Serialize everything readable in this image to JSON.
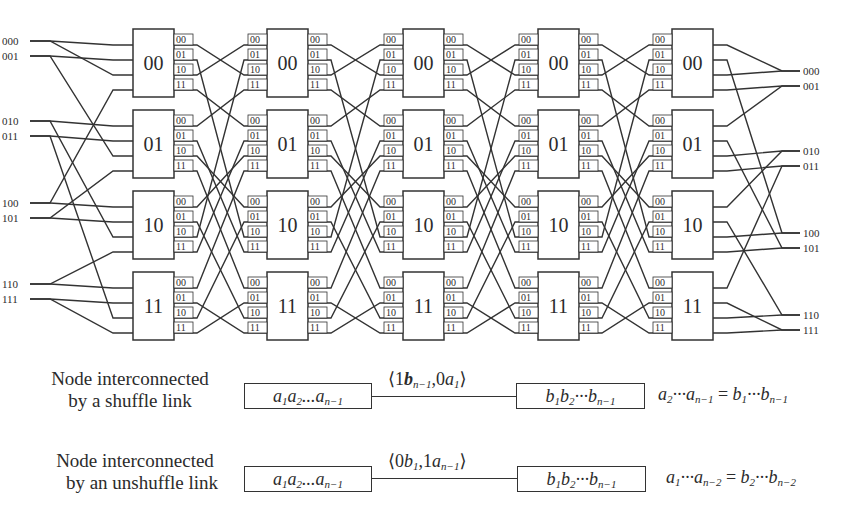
{
  "diagram": {
    "node_labels": [
      "00",
      "01",
      "10",
      "11"
    ],
    "port_labels": [
      "00",
      "01",
      "10",
      "11"
    ],
    "columns_x": [
      133,
      267,
      403,
      538,
      672
    ],
    "box_width": 41,
    "rows_y": [
      29,
      110,
      191,
      272
    ],
    "box_height": 68,
    "port_offsets": [
      12,
      27,
      42,
      57
    ],
    "port_label_width": 19,
    "inputs": {
      "labels": [
        "000",
        "001",
        "010",
        "011",
        "100",
        "101",
        "110",
        "111"
      ],
      "y": [
        41,
        56,
        121,
        136,
        203,
        218,
        284,
        299
      ],
      "label_x": 2,
      "line_start_x": 30,
      "fork_x": 50,
      "edges": [
        {
          "in": 0,
          "node": 0,
          "port": 0
        },
        {
          "in": 0,
          "node": 0,
          "port": 2
        },
        {
          "in": 1,
          "node": 0,
          "port": 1
        },
        {
          "in": 1,
          "node": 1,
          "port": 2
        },
        {
          "in": 2,
          "node": 1,
          "port": 0
        },
        {
          "in": 2,
          "node": 2,
          "port": 2
        },
        {
          "in": 3,
          "node": 1,
          "port": 1
        },
        {
          "in": 3,
          "node": 3,
          "port": 2
        },
        {
          "in": 4,
          "node": 2,
          "port": 0
        },
        {
          "in": 4,
          "node": 0,
          "port": 3
        },
        {
          "in": 5,
          "node": 2,
          "port": 1
        },
        {
          "in": 5,
          "node": 1,
          "port": 3
        },
        {
          "in": 6,
          "node": 3,
          "port": 0
        },
        {
          "in": 6,
          "node": 2,
          "port": 3
        },
        {
          "in": 7,
          "node": 3,
          "port": 1
        },
        {
          "in": 7,
          "node": 3,
          "port": 3
        }
      ]
    },
    "outputs": {
      "labels": [
        "000",
        "001",
        "010",
        "011",
        "100",
        "101",
        "110",
        "111"
      ],
      "y": [
        71,
        86,
        151,
        166,
        233,
        248,
        315,
        330
      ],
      "label_x": 803,
      "line_end_x": 800,
      "merge_x": 782,
      "edges": [
        {
          "node": 0,
          "port": 0,
          "out": 0
        },
        {
          "node": 0,
          "port": 1,
          "out": 4
        },
        {
          "node": 0,
          "port": 2,
          "out": 0
        },
        {
          "node": 0,
          "port": 3,
          "out": 1
        },
        {
          "node": 1,
          "port": 0,
          "out": 1
        },
        {
          "node": 1,
          "port": 1,
          "out": 5
        },
        {
          "node": 1,
          "port": 2,
          "out": 2
        },
        {
          "node": 1,
          "port": 3,
          "out": 3
        },
        {
          "node": 2,
          "port": 0,
          "out": 2
        },
        {
          "node": 2,
          "port": 1,
          "out": 6
        },
        {
          "node": 2,
          "port": 2,
          "out": 4
        },
        {
          "node": 2,
          "port": 3,
          "out": 5
        },
        {
          "node": 3,
          "port": 0,
          "out": 3
        },
        {
          "node": 3,
          "port": 1,
          "out": 7
        },
        {
          "node": 3,
          "port": 2,
          "out": 6
        },
        {
          "node": 3,
          "port": 3,
          "out": 7
        }
      ]
    },
    "line_color": "#333333",
    "box_fill": "#ffffff"
  },
  "legend": {
    "shuffle": {
      "description_line1": "Node interconnected",
      "description_line2": "by a shuffle link",
      "left_node": {
        "base": "a",
        "parts": [
          "1",
          "2",
          "n−1"
        ]
      },
      "link_label": "⟨1bₙ₋₁,0a₁⟩",
      "link_label_parts": {
        "p1": "⟨1",
        "v1": "b",
        "s1": "n−1",
        "p2": ",0",
        "v2": "a",
        "s2": "1",
        "p3": "⟩"
      },
      "right_node": {
        "base": "b",
        "parts": [
          "1",
          "2",
          "n−1"
        ]
      },
      "equation": {
        "lhs_var": "a",
        "lhs_sub1": "2",
        "lhs_sub2": "n−1",
        "op": "=",
        "rhs_var": "b",
        "rhs_sub1": "1",
        "rhs_sub2": "n−1"
      }
    },
    "unshuffle": {
      "description_line1": "Node interconnected",
      "description_line2": "by an unshuffle link",
      "left_node": {
        "base": "a",
        "parts": [
          "1",
          "2",
          "n−1"
        ]
      },
      "link_label": "⟨0b₁,1aₙ₋₁⟩",
      "link_label_parts": {
        "p1": "⟨0",
        "v1": "b",
        "s1": "1",
        "p2": ",1",
        "v2": "a",
        "s2": "n−1",
        "p3": "⟩"
      },
      "right_node": {
        "base": "b",
        "parts": [
          "1",
          "2",
          "n−1"
        ]
      },
      "equation": {
        "lhs_var": "a",
        "lhs_sub1": "1",
        "lhs_sub2": "n−2",
        "op": "=",
        "rhs_var": "b",
        "rhs_sub1": "2",
        "rhs_sub2": "n−2"
      }
    }
  }
}
